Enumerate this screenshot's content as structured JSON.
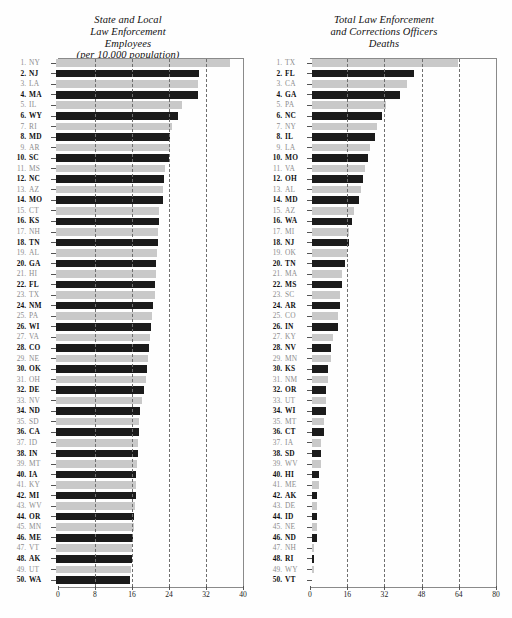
{
  "chart_data": [
    {
      "type": "bar",
      "orientation": "horizontal",
      "title": "State and Local Law Enforcement Employees (per 10,000 population)",
      "title_lines": [
        "State and Local",
        "Law Enforcement",
        "Employees",
        "(per 10,000 population)"
      ],
      "xlabel": "",
      "ylabel": "",
      "xlim": [
        0,
        40
      ],
      "xticks": [
        0,
        8,
        16,
        24,
        32,
        40
      ],
      "grid": true,
      "grid_axis": "x",
      "legend": "none",
      "colors": {
        "odd_rank_bar": "#c9c9c9",
        "even_rank_bar": "#1b1b1b"
      },
      "categories": [
        "NY",
        "NJ",
        "LA",
        "MA",
        "IL",
        "WY",
        "RI",
        "MD",
        "AR",
        "SC",
        "MS",
        "NC",
        "AZ",
        "MO",
        "CT",
        "KS",
        "NH",
        "TN",
        "AL",
        "GA",
        "HI",
        "FL",
        "TX",
        "NM",
        "PA",
        "WI",
        "VA",
        "CO",
        "NE",
        "OK",
        "OH",
        "DE",
        "NV",
        "ND",
        "SD",
        "CA",
        "ID",
        "IN",
        "MT",
        "IA",
        "KY",
        "MI",
        "WV",
        "OR",
        "MN",
        "ME",
        "VT",
        "AK",
        "UT",
        "WA"
      ],
      "ranks": [
        1,
        2,
        3,
        4,
        5,
        6,
        7,
        8,
        9,
        10,
        11,
        12,
        13,
        14,
        15,
        16,
        17,
        18,
        19,
        20,
        21,
        22,
        23,
        24,
        25,
        26,
        27,
        28,
        29,
        30,
        31,
        32,
        33,
        34,
        35,
        36,
        37,
        38,
        39,
        40,
        41,
        42,
        43,
        44,
        45,
        46,
        47,
        48,
        49,
        50
      ],
      "values": [
        37.6,
        31.0,
        30.6,
        30.6,
        27.2,
        26.4,
        25.0,
        24.7,
        24.6,
        24.4,
        23.5,
        23.4,
        23.2,
        23.1,
        22.3,
        22.2,
        22.1,
        22.0,
        21.9,
        21.7,
        21.6,
        21.4,
        21.3,
        21.0,
        20.8,
        20.5,
        20.3,
        20.1,
        19.9,
        19.6,
        19.4,
        19.1,
        18.6,
        18.2,
        18.0,
        17.9,
        17.8,
        17.7,
        17.6,
        17.4,
        17.3,
        17.2,
        17.1,
        16.9,
        16.8,
        16.6,
        16.5,
        16.4,
        16.2,
        15.9
      ]
    },
    {
      "type": "bar",
      "orientation": "horizontal",
      "title": "Total Law Enforcement and Corrections Officers Deaths",
      "title_lines": [
        "Total Law Enforcement",
        "and Corrections Officers",
        "Deaths"
      ],
      "xlabel": "",
      "ylabel": "",
      "xlim": [
        0,
        80
      ],
      "xticks": [
        0,
        16,
        32,
        48,
        64,
        80
      ],
      "grid": true,
      "grid_axis": "x",
      "legend": "none",
      "colors": {
        "odd_rank_bar": "#c9c9c9",
        "even_rank_bar": "#1b1b1b"
      },
      "categories": [
        "TX",
        "FL",
        "CA",
        "GA",
        "PA",
        "NC",
        "NY",
        "IL",
        "LA",
        "MO",
        "VA",
        "OH",
        "AL",
        "MD",
        "AZ",
        "WA",
        "MI",
        "NJ",
        "OK",
        "TN",
        "MA",
        "MS",
        "SC",
        "AR",
        "CO",
        "IN",
        "KY",
        "NV",
        "MN",
        "KS",
        "NM",
        "OR",
        "UT",
        "WI",
        "MT",
        "CT",
        "IA",
        "SD",
        "WV",
        "HI",
        "ME",
        "AK",
        "DE",
        "ID",
        "NE",
        "ND",
        "NH",
        "RI",
        "WY",
        "VT"
      ],
      "ranks": [
        1,
        2,
        3,
        4,
        5,
        6,
        7,
        8,
        9,
        10,
        11,
        12,
        13,
        14,
        15,
        16,
        17,
        18,
        19,
        20,
        21,
        22,
        23,
        24,
        25,
        26,
        27,
        28,
        29,
        30,
        31,
        32,
        33,
        34,
        35,
        36,
        37,
        38,
        39,
        40,
        41,
        42,
        43,
        44,
        45,
        46,
        47,
        48,
        49,
        50
      ],
      "values": [
        63,
        44,
        41,
        38,
        32,
        30,
        28,
        27,
        25,
        24,
        23,
        22,
        21,
        20,
        18,
        17,
        16,
        16,
        15,
        14,
        13,
        13,
        12,
        12,
        11,
        11,
        9,
        8,
        8,
        7,
        7,
        6,
        6,
        6,
        5,
        5,
        4,
        4,
        4,
        3,
        3,
        2,
        2,
        2,
        2,
        2,
        1,
        1,
        1,
        0
      ]
    }
  ],
  "axis_tick_labels": {
    "left": [
      "0",
      "8",
      "16",
      "24",
      "32",
      "40"
    ],
    "right": [
      "0",
      "16",
      "32",
      "48",
      "64",
      "80"
    ]
  }
}
